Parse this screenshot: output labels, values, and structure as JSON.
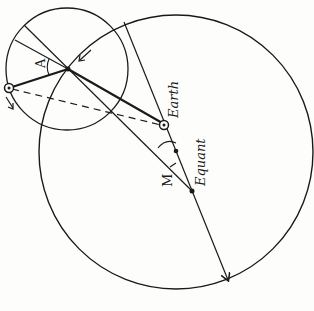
{
  "diagram": {
    "labels": {
      "earth": "Earth",
      "equant": "Equant",
      "angle_a": "A",
      "angle_m": "M"
    },
    "colors": {
      "ink": "#1a1a1a",
      "paper": "#fdfdfb"
    },
    "elements": {
      "deferent": "large circle (deferent)",
      "epicycle": "small circle (epicycle)",
      "planet": "planet marker on epicycle",
      "epicycle_center": "center of epicycle",
      "deferent_center": "dot between Earth and Equant",
      "apsidal_line": "line through Earth, deferent center and Equant with arrow",
      "sight_line": "dashed line from planet to Earth"
    }
  }
}
